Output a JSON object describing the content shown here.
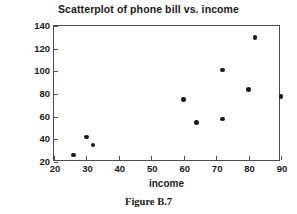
{
  "chart_data": {
    "type": "scatter",
    "title": "Scatterplot of phone bill vs. income",
    "xlabel": "income",
    "ylabel": "Phone bill",
    "xlim": [
      20,
      90
    ],
    "ylim": [
      20,
      140
    ],
    "xticks": [
      20,
      30,
      40,
      50,
      60,
      70,
      80,
      90
    ],
    "yticks": [
      20,
      40,
      60,
      80,
      100,
      120,
      140
    ],
    "grid": false,
    "legend": null,
    "marker_color": "#1a1a1a",
    "points": [
      {
        "x": 26,
        "y": 26
      },
      {
        "x": 30,
        "y": 42
      },
      {
        "x": 32,
        "y": 35
      },
      {
        "x": 60,
        "y": 75
      },
      {
        "x": 64,
        "y": 55
      },
      {
        "x": 72,
        "y": 58
      },
      {
        "x": 72,
        "y": 101
      },
      {
        "x": 80,
        "y": 84
      },
      {
        "x": 82,
        "y": 130
      },
      {
        "x": 90,
        "y": 78
      }
    ]
  },
  "caption": "Figure B.7"
}
